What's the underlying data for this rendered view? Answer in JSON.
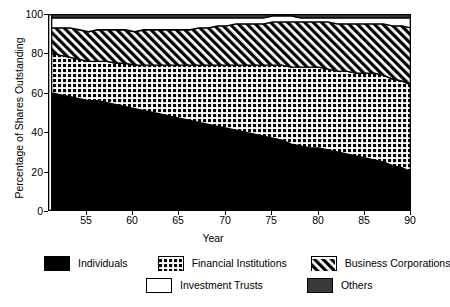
{
  "chart_data": {
    "type": "area",
    "title": "",
    "xlabel": "Year",
    "ylabel": "Percentage of Shares Outstanding",
    "xlim": [
      50.6,
      90
    ],
    "ylim": [
      0,
      100
    ],
    "xticks": [
      55,
      60,
      65,
      70,
      75,
      80,
      85,
      90
    ],
    "yticks": [
      0,
      20,
      40,
      60,
      80,
      100
    ],
    "grid": false,
    "legend_position": "bottom",
    "stacked": true,
    "x": [
      51,
      52,
      53,
      54,
      55,
      56,
      57,
      58,
      59,
      60,
      61,
      62,
      63,
      64,
      65,
      66,
      67,
      68,
      69,
      70,
      71,
      72,
      73,
      74,
      75,
      76,
      77,
      78,
      79,
      80,
      81,
      82,
      83,
      84,
      85,
      86,
      87,
      88,
      89,
      90
    ],
    "series": [
      {
        "name": "Individuals",
        "fill": "black-solid",
        "values": [
          60,
          59,
          58,
          57,
          56,
          56,
          55,
          54,
          53,
          52,
          51,
          50,
          49,
          48,
          47,
          46,
          45,
          44,
          43,
          42,
          41,
          40,
          39,
          38,
          37,
          36,
          34,
          33,
          32,
          32,
          31,
          30,
          29,
          28,
          27,
          26,
          25,
          23,
          22,
          20
        ]
      },
      {
        "name": "Financial Institutions",
        "fill": "dotted-grid",
        "values": [
          20,
          20,
          20,
          20,
          20,
          20,
          21,
          21,
          22,
          22,
          23,
          24,
          25,
          26,
          27,
          28,
          29,
          30,
          31,
          32,
          33,
          34,
          35,
          36,
          37,
          38,
          39,
          40,
          41,
          41,
          41,
          41,
          42,
          42,
          43,
          44,
          44,
          44,
          44,
          44
        ]
      },
      {
        "name": "Business Corporations",
        "fill": "diagonal-hatch",
        "values": [
          13,
          14,
          15,
          15,
          15,
          16,
          16,
          17,
          17,
          17,
          18,
          18,
          18,
          18,
          18,
          18,
          19,
          19,
          20,
          20,
          21,
          21,
          21,
          21,
          22,
          22,
          23,
          23,
          23,
          23,
          24,
          24,
          24,
          25,
          25,
          25,
          26,
          27,
          28,
          29
        ]
      },
      {
        "name": "Investment Trusts",
        "fill": "white-solid",
        "values": [
          5,
          5,
          5,
          6,
          7,
          6,
          6,
          6,
          6,
          7,
          6,
          6,
          6,
          6,
          6,
          6,
          5,
          5,
          4,
          4,
          3,
          3,
          3,
          3,
          3,
          3,
          3,
          2,
          2,
          2,
          2,
          3,
          3,
          3,
          3,
          3,
          3,
          4,
          4,
          5
        ]
      },
      {
        "name": "Others",
        "fill": "dark-gray",
        "values": [
          2,
          2,
          2,
          2,
          2,
          2,
          2,
          2,
          2,
          2,
          2,
          2,
          2,
          2,
          2,
          2,
          2,
          2,
          2,
          2,
          2,
          2,
          2,
          2,
          1,
          1,
          1,
          2,
          2,
          2,
          2,
          2,
          2,
          2,
          2,
          2,
          2,
          2,
          2,
          2
        ]
      }
    ]
  },
  "legend": {
    "items": [
      {
        "label": "Individuals",
        "swatch": "black-solid"
      },
      {
        "label": "Financial Institutions",
        "swatch": "dotted-grid"
      },
      {
        "label": "Business Corporations",
        "swatch": "diagonal-hatch"
      },
      {
        "label": "Investment Trusts",
        "swatch": "white-solid"
      },
      {
        "label": "Others",
        "swatch": "dark-gray"
      }
    ]
  }
}
